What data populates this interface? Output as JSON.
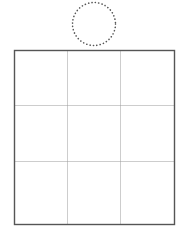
{
  "diagram": {
    "circle": {
      "cx": 94,
      "cy": 24,
      "r": 21.5,
      "stroke": "#555555",
      "style": "dotted"
    },
    "grid": {
      "rows": 3,
      "cols": 3,
      "x": 14.5,
      "y": 50.5,
      "width": 160,
      "height": 174,
      "col_dividers": [
        67.5,
        120.5
      ],
      "row_dividers": [
        105.5,
        161.5
      ],
      "border_color": "#555555",
      "divider_color": "#9a9a9a",
      "cells": [
        [
          "",
          "",
          ""
        ],
        [
          "",
          "",
          ""
        ],
        [
          "",
          "",
          ""
        ]
      ]
    }
  }
}
